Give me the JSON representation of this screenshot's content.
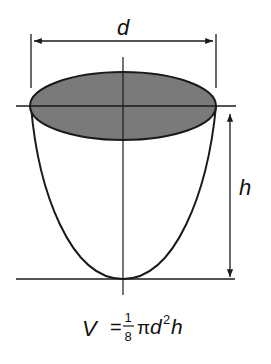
{
  "diagram": {
    "labels": {
      "diameter": "d",
      "height": "h"
    },
    "formula": {
      "lhs": "V",
      "equals": "=",
      "frac_num": "1",
      "frac_den": "8",
      "pi": "π",
      "d": "d",
      "exp": "2",
      "h": "h"
    },
    "colors": {
      "stroke": "#1a1a1a",
      "top_fill": "#7a7a7a",
      "background": "#ffffff"
    }
  }
}
